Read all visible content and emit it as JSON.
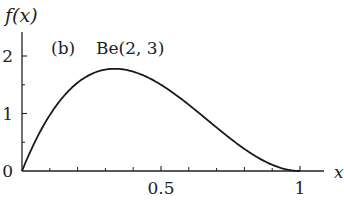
{
  "chart_data": {
    "type": "line",
    "title": "(b)  Be(2, 3)",
    "panel_label": "(b)",
    "distribution_label": "Be(2, 3)",
    "xlabel": "x",
    "ylabel": "f(x)",
    "xlim": [
      0,
      1.08
    ],
    "ylim": [
      0,
      2.5
    ],
    "grid": false,
    "legend": "none",
    "x_ticks_major": [
      0.5,
      1
    ],
    "x_tick_labels": [
      "0.5",
      "1"
    ],
    "x_ticks_minor": [
      0.1,
      0.2,
      0.3,
      0.4,
      0.6,
      0.7,
      0.8,
      0.9
    ],
    "y_ticks_major": [
      0,
      1,
      2
    ],
    "y_tick_labels": [
      "0",
      "1",
      "2"
    ],
    "y_ticks_minor": [
      0.5,
      1.5
    ],
    "series": [
      {
        "name": "Be(2,3) density f(x)=12x(1-x)^2",
        "x": [
          0,
          0.05,
          0.1,
          0.15,
          0.2,
          0.25,
          0.3,
          0.3333,
          0.35,
          0.4,
          0.45,
          0.5,
          0.55,
          0.6,
          0.65,
          0.7,
          0.75,
          0.8,
          0.85,
          0.9,
          0.95,
          1.0
        ],
        "values": [
          0,
          0.5415,
          0.972,
          1.3005,
          1.536,
          1.6875,
          1.764,
          1.7778,
          1.7745,
          1.728,
          1.6335,
          1.5,
          1.3365,
          1.152,
          0.9555,
          0.756,
          0.5625,
          0.384,
          0.2295,
          0.108,
          0.0285,
          0
        ]
      }
    ]
  }
}
